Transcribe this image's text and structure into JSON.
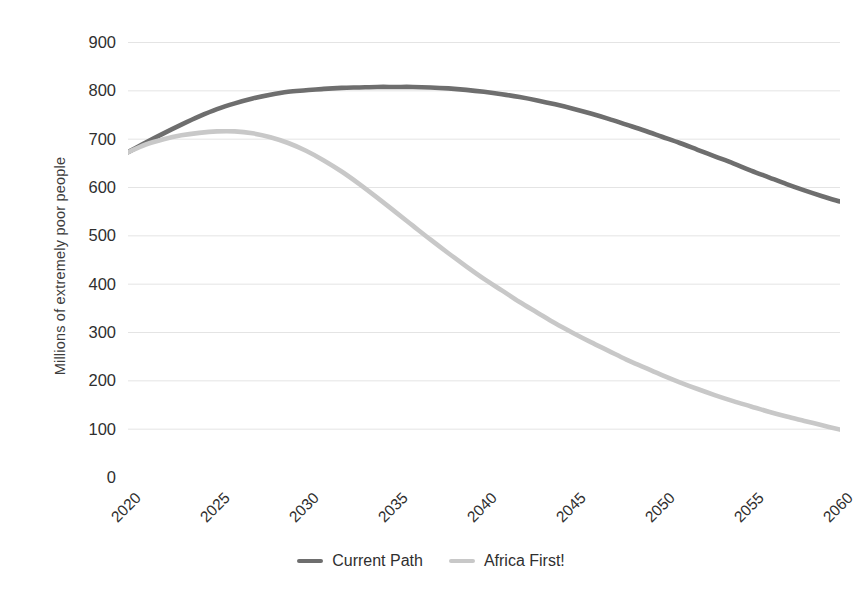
{
  "chart_data": {
    "type": "line",
    "title": "",
    "xlabel": "",
    "ylabel": "Millions of extremely poor people",
    "xlim": [
      2020,
      2060
    ],
    "ylim": [
      0,
      900
    ],
    "grid": true,
    "legend_position": "bottom-center",
    "x_ticks": [
      "2020",
      "2025",
      "2030",
      "2035",
      "2040",
      "2045",
      "2050",
      "2055",
      "2060"
    ],
    "y_ticks": [
      "0",
      "100",
      "200",
      "300",
      "400",
      "500",
      "600",
      "700",
      "800",
      "900"
    ],
    "x": [
      2020,
      2021,
      2022,
      2023,
      2024,
      2025,
      2026,
      2027,
      2028,
      2029,
      2030,
      2031,
      2032,
      2033,
      2034,
      2035,
      2036,
      2037,
      2038,
      2039,
      2040,
      2041,
      2042,
      2043,
      2044,
      2045,
      2046,
      2047,
      2048,
      2049,
      2050,
      2051,
      2052,
      2053,
      2054,
      2055,
      2056,
      2057,
      2058,
      2059,
      2060
    ],
    "series": [
      {
        "name": "Current Path",
        "color": "#6e6e6e",
        "values": [
          672,
          692,
          711,
          729,
          746,
          761,
          773,
          783,
          791,
          797,
          800,
          803,
          805,
          806,
          807,
          807,
          807,
          806,
          804,
          801,
          797,
          792,
          786,
          779,
          771,
          762,
          752,
          741,
          729,
          717,
          704,
          691,
          677,
          663,
          649,
          634,
          620,
          606,
          593,
          581,
          570
        ]
      },
      {
        "name": "Africa First!",
        "color": "#c8c8c8",
        "values": [
          672,
          688,
          699,
          707,
          712,
          715,
          715,
          711,
          703,
          691,
          675,
          655,
          632,
          606,
          578,
          549,
          520,
          491,
          463,
          436,
          410,
          386,
          362,
          340,
          318,
          298,
          279,
          261,
          243,
          227,
          211,
          196,
          182,
          169,
          157,
          146,
          135,
          125,
          116,
          107,
          98
        ]
      }
    ]
  },
  "axis": {
    "y_title": "Millions of extremely poor people"
  },
  "legend": {
    "items": [
      {
        "label": "Current Path",
        "color": "#6e6e6e"
      },
      {
        "label": "Africa First!",
        "color": "#c8c8c8"
      }
    ]
  }
}
